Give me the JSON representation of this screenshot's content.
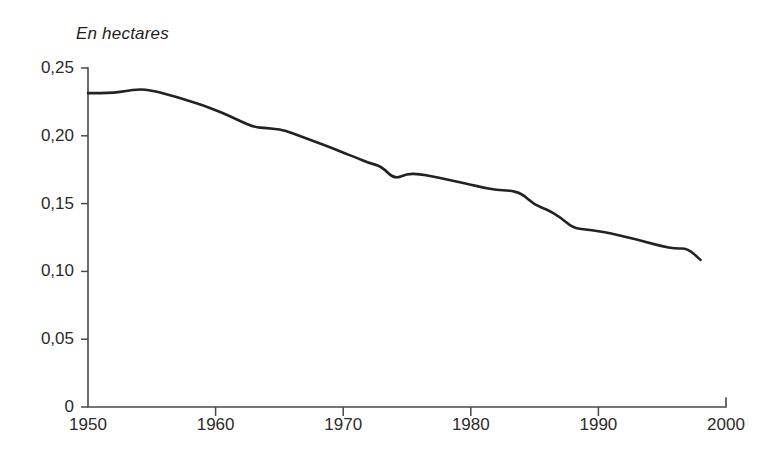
{
  "chart_data": {
    "type": "line",
    "title": "En hectares",
    "xlabel": "",
    "ylabel": "En hectares",
    "xlim": [
      1950,
      2000
    ],
    "ylim": [
      0,
      0.25
    ],
    "grid": false,
    "legend": "none",
    "xticks": [
      "1950",
      "1960",
      "1970",
      "1980",
      "1990",
      "2000"
    ],
    "xtick_values": [
      1950,
      1960,
      1970,
      1980,
      1990,
      2000
    ],
    "yticks": [
      "0",
      "0,05",
      "0,10",
      "0,15",
      "0,20",
      "0,25"
    ],
    "ytick_values": [
      0,
      0.05,
      0.1,
      0.15,
      0.2,
      0.25
    ],
    "decimal_separator": ",",
    "line_color": "#222222",
    "axis_color": "#4a4a4a",
    "background_color": "#ffffff",
    "series": [
      {
        "name": "Surface par habitant",
        "x": [
          1950,
          1951,
          1952,
          1953,
          1954,
          1955,
          1956,
          1957,
          1958,
          1959,
          1960,
          1961,
          1962,
          1963,
          1964,
          1965,
          1966,
          1967,
          1968,
          1969,
          1970,
          1971,
          1972,
          1973,
          1974,
          1975,
          1976,
          1977,
          1978,
          1979,
          1980,
          1981,
          1982,
          1983,
          1984,
          1985,
          1986,
          1987,
          1988,
          1989,
          1990,
          1991,
          1992,
          1993,
          1994,
          1995,
          1996,
          1997,
          1998
        ],
        "values": [
          0.2315,
          0.2315,
          0.2318,
          0.233,
          0.2345,
          0.2335,
          0.231,
          0.2285,
          0.2255,
          0.2225,
          0.219,
          0.215,
          0.2105,
          0.2065,
          0.2055,
          0.205,
          0.202,
          0.1985,
          0.195,
          0.1915,
          0.1875,
          0.184,
          0.18,
          0.1775,
          0.168,
          0.172,
          0.1718,
          0.17,
          0.168,
          0.166,
          0.164,
          0.1618,
          0.16,
          0.1598,
          0.1575,
          0.149,
          0.1455,
          0.14,
          0.132,
          0.131,
          0.1298,
          0.128,
          0.1258,
          0.1235,
          0.121,
          0.1185,
          0.1168,
          0.117,
          0.1085
        ]
      }
    ]
  }
}
